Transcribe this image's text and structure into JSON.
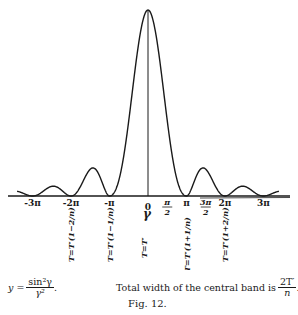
{
  "chart_data": {
    "type": "line",
    "title": "",
    "function": "y = sin^2(gamma) / gamma^2",
    "xlabel": "gamma",
    "ylabel": "",
    "xlim_over_pi": [
      -3.4,
      3.4
    ],
    "ylim": [
      0,
      1.05
    ],
    "grid": false,
    "x_ticks": [
      {
        "value_over_pi": -3,
        "label": "-3π"
      },
      {
        "value_over_pi": -2,
        "label": "-2π"
      },
      {
        "value_over_pi": -1,
        "label": "-π"
      },
      {
        "value_over_pi": 0,
        "label": "0"
      },
      {
        "value_over_pi": 0.5,
        "label": "π/2"
      },
      {
        "value_over_pi": 1,
        "label": "π"
      },
      {
        "value_over_pi": 1.5,
        "label": "3π/2"
      },
      {
        "value_over_pi": 2,
        "label": "2π"
      },
      {
        "value_over_pi": 3,
        "label": "3π"
      }
    ],
    "axis_symbol": "γ",
    "vertical_labels": [
      {
        "at_over_pi": -2,
        "label": "T=T′(1−2/n)"
      },
      {
        "at_over_pi": -1,
        "label": "T=T′(1−1/n)"
      },
      {
        "at_over_pi": 0,
        "label": "T=T′"
      },
      {
        "at_over_pi": 1,
        "label": "T=T′(1+1/n)"
      },
      {
        "at_over_pi": 2,
        "label": "T=T′(1+2/n)"
      }
    ],
    "series": [
      {
        "name": "sin²γ/γ²",
        "peak": {
          "x": 0,
          "y": 1
        },
        "zeros_over_pi": [
          -3,
          -2,
          -1,
          1,
          2,
          3
        ]
      }
    ]
  },
  "caption": {
    "equation_lhs": "y =",
    "equation_num": "sin²γ",
    "equation_den": "γ²",
    "equation_end": ".",
    "note_text": "Total width of the central band is",
    "note_num": "2T′",
    "note_den": "n",
    "note_end": ".",
    "figure_label": "Fig. 12."
  }
}
